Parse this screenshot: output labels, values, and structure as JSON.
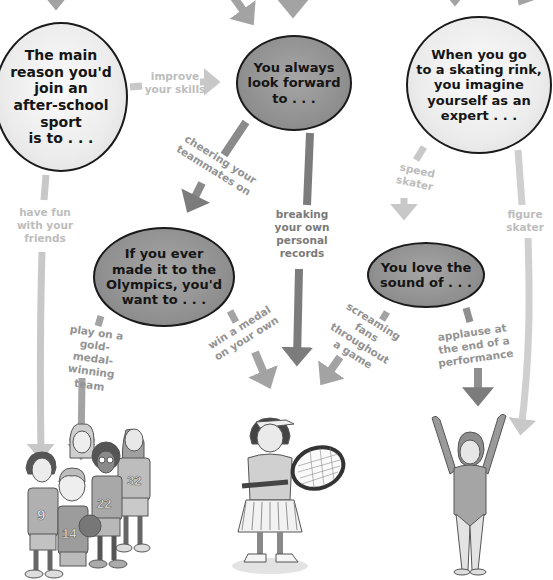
{
  "colors": {
    "arrow_light": "#c8c8c8",
    "arrow_mid": "#a3a3a3",
    "arrow_dark": "#7c7c7c",
    "bubble_light": "#ececec",
    "bubble_dark": "#909090",
    "text": "#151515"
  },
  "questions": [
    {
      "id": "q1",
      "text": "The main\nreason you'd\njoin an\nafter-school\nsport\nis to . . ."
    },
    {
      "id": "q2",
      "text": "You always\nlook forward\nto . . ."
    },
    {
      "id": "q3",
      "text": "When you go\nto a skating rink,\nyou imagine\nyourself as an\nexpert . . ."
    },
    {
      "id": "q4",
      "text": "If you ever\nmade it to the\nOlympics, you'd\nwant to . . ."
    },
    {
      "id": "q5",
      "text": "You love the\nsound of . . ."
    }
  ],
  "answers": [
    {
      "from": "q1",
      "to": "q2",
      "text": "improve\nyour skills"
    },
    {
      "from": "q1",
      "to": "team-sports",
      "text": "have fun\nwith your\nfriends"
    },
    {
      "from": "q2",
      "to": "q4",
      "text": "cheering your\nteammates on"
    },
    {
      "from": "q2",
      "to": "individual-sports",
      "text": "breaking\nyour own\npersonal\nrecords"
    },
    {
      "from": "q3",
      "to": "q5",
      "text": "speed\nskater"
    },
    {
      "from": "q3",
      "to": "performance-sports",
      "text": "figure\nskater"
    },
    {
      "from": "q4",
      "to": "team-sports",
      "text": "play on a\ngold-medal-\nwinning team"
    },
    {
      "from": "q4",
      "to": "individual-sports",
      "text": "win a medal\non your own"
    },
    {
      "from": "q5",
      "to": "individual-sports",
      "text": "screaming\nfans throughout\na game"
    },
    {
      "from": "q5",
      "to": "performance-sports",
      "text": "applause at\nthe end of a\nperformance"
    }
  ],
  "results": [
    {
      "id": "team-sports",
      "illustration": "basketball-team",
      "jersey_numbers": [
        "9",
        "14",
        "22",
        "32"
      ]
    },
    {
      "id": "individual-sports",
      "illustration": "tennis-player"
    },
    {
      "id": "performance-sports",
      "illustration": "gymnast"
    }
  ]
}
